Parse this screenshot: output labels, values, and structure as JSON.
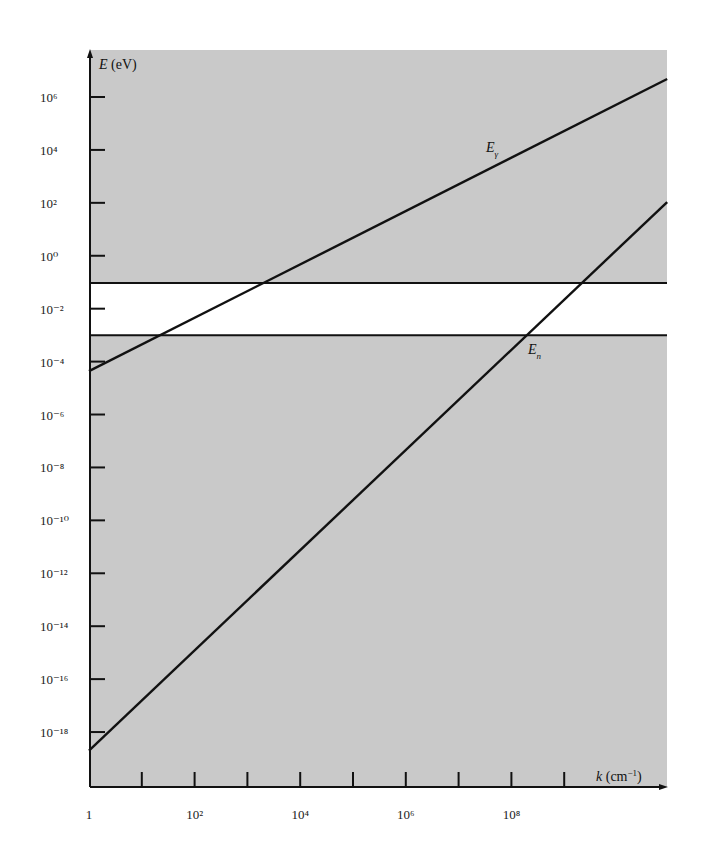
{
  "chart_data": {
    "type": "line",
    "title": "",
    "xlabel": "k (cm⁻¹)",
    "ylabel": "E (eV)",
    "xscale": "log",
    "yscale": "log",
    "xlim_exp": [
      0,
      10.95
    ],
    "ylim_exp": [
      -19.9,
      7.8
    ],
    "x_ticks": [
      {
        "exp": 0,
        "label": "1"
      },
      {
        "exp": 1,
        "label": ""
      },
      {
        "exp": 2,
        "label": "10²"
      },
      {
        "exp": 3,
        "label": ""
      },
      {
        "exp": 4,
        "label": "10⁴"
      },
      {
        "exp": 5,
        "label": ""
      },
      {
        "exp": 6,
        "label": "10⁶"
      },
      {
        "exp": 7,
        "label": ""
      },
      {
        "exp": 8,
        "label": "10⁸"
      },
      {
        "exp": 9,
        "label": ""
      }
    ],
    "y_ticks": [
      {
        "exp": 6,
        "label": "10⁶"
      },
      {
        "exp": 4,
        "label": "10⁴"
      },
      {
        "exp": 2,
        "label": "10²"
      },
      {
        "exp": 0,
        "label": "10⁰"
      },
      {
        "exp": -2,
        "label": "10⁻²"
      },
      {
        "exp": -4,
        "label": "10⁻⁴"
      },
      {
        "exp": -6,
        "label": "10⁻⁶"
      },
      {
        "exp": -8,
        "label": "10⁻⁸"
      },
      {
        "exp": -10,
        "label": "10⁻¹⁰"
      },
      {
        "exp": -12,
        "label": "10⁻¹²"
      },
      {
        "exp": -14,
        "label": "10⁻¹⁴"
      },
      {
        "exp": -16,
        "label": "10⁻¹⁶"
      },
      {
        "exp": -18,
        "label": "10⁻¹⁸"
      }
    ],
    "series": [
      {
        "name": "Eγ",
        "label": "E",
        "subscript": "γ",
        "log_k": [
          0,
          10.95
        ],
        "log_E": [
          -4.36,
          6.68
        ]
      },
      {
        "name": "En",
        "label": "E",
        "subscript": "n",
        "log_k": [
          0,
          10.95
        ],
        "log_E": [
          -18.7,
          2.03
        ]
      }
    ],
    "band": {
      "description": "unshaded region",
      "log_E_low": -3.0,
      "log_E_high": -1.03
    },
    "grid": false,
    "legend": "inline labels",
    "colors": {
      "background": "#c9c9c9",
      "band": "#ffffff",
      "line": "#111111"
    }
  }
}
